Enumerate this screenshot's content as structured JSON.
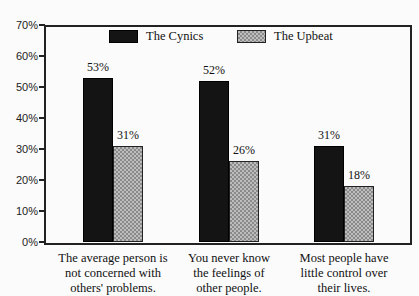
{
  "chart_data": {
    "type": "bar",
    "title": "",
    "xlabel": "",
    "ylabel": "",
    "ylim": [
      0,
      70
    ],
    "yticks": [
      "0%",
      "10%",
      "20%",
      "30%",
      "40%",
      "50%",
      "60%",
      "70%"
    ],
    "categories": [
      "The average person is not concerned with others' problems.",
      "You never know the feelings of other people.",
      "Most people have little control over their lives."
    ],
    "category_lines": [
      [
        "The average person is",
        "not concerned with",
        "others' problems."
      ],
      [
        "You never know",
        "the feelings of",
        "other people."
      ],
      [
        "Most people have",
        "little control over",
        "their lives."
      ]
    ],
    "series": [
      {
        "name": "The Cynics",
        "values": [
          53,
          52,
          31
        ],
        "labels": [
          "53%",
          "52%",
          "31%"
        ],
        "color": "#141414"
      },
      {
        "name": "The Upbeat",
        "values": [
          31,
          26,
          18
        ],
        "labels": [
          "31%",
          "26%",
          "18%"
        ],
        "color": "#b0b0b0"
      }
    ],
    "legend_position": "top-inside",
    "grid": false
  }
}
